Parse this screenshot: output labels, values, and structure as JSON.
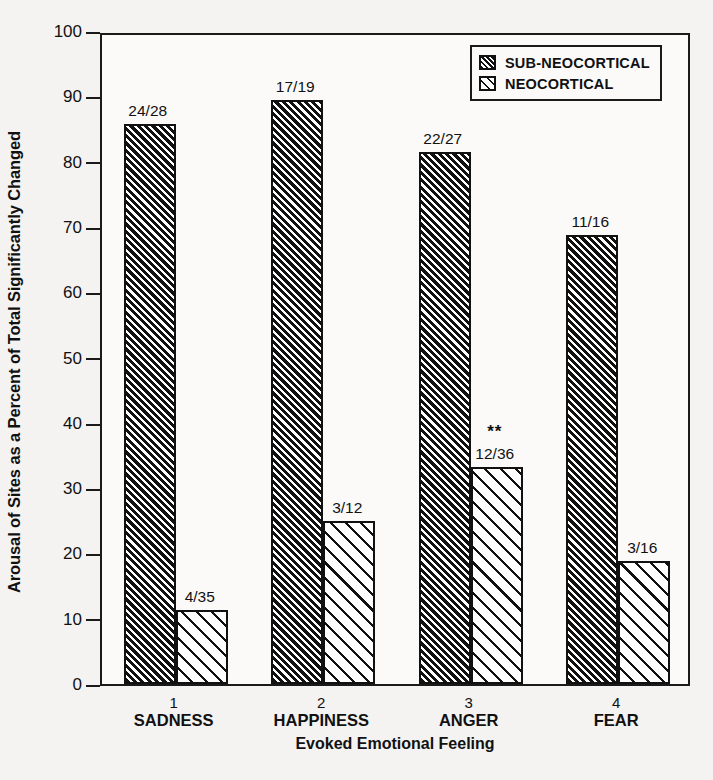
{
  "chart_data": {
    "type": "bar",
    "title": "",
    "xlabel": "Evoked Emotional Feeling",
    "ylabel": "Arousal of Sites as a Percent of Total Significantly Changed",
    "ylim": [
      0,
      100
    ],
    "ytick_step": 10,
    "yticks": [
      "0",
      "10",
      "20",
      "30",
      "40",
      "50",
      "60",
      "70",
      "80",
      "90",
      "100"
    ],
    "grid": false,
    "legend_position": "top-right",
    "categories": [
      "SADNESS",
      "HAPPINESS",
      "ANGER",
      "FEAR"
    ],
    "category_numbers": [
      "1",
      "2",
      "3",
      "4"
    ],
    "series": [
      {
        "name": "SUB-NEOCORTICAL",
        "fill": "dark-hatch",
        "values": [
          85.7,
          89.5,
          81.5,
          68.8
        ],
        "data_labels": [
          "24/28",
          "17/19",
          "22/27",
          "11/16"
        ],
        "significance": [
          "",
          "",
          "",
          ""
        ]
      },
      {
        "name": "NEOCORTICAL",
        "fill": "light-hatch",
        "values": [
          11.4,
          25.0,
          33.3,
          18.8
        ],
        "data_labels": [
          "4/35",
          "3/12",
          "12/36",
          "3/16"
        ],
        "significance": [
          "",
          "",
          "**",
          ""
        ]
      }
    ],
    "colors": {
      "ink": "#111111",
      "background": "#f4f3f1",
      "plot_background": "#fbfaf9"
    }
  },
  "legend": {
    "items": [
      {
        "label": "SUB-NEOCORTICAL",
        "swatch": "dark-hatch"
      },
      {
        "label": "NEOCORTICAL",
        "swatch": "light-hatch"
      }
    ]
  }
}
